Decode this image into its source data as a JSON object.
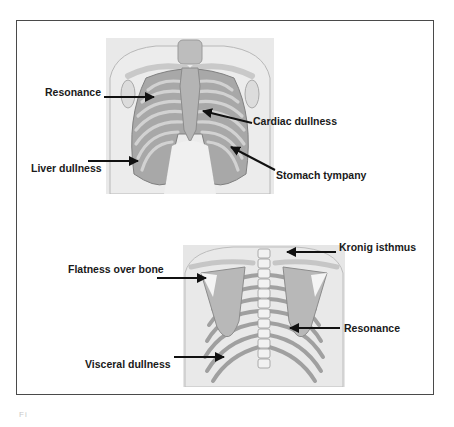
{
  "figure": {
    "anterior_view": {
      "labels": [
        {
          "id": "resonance",
          "text": "Resonance"
        },
        {
          "id": "cardiac-dullness",
          "text": "Cardiac dullness"
        },
        {
          "id": "liver-dullness",
          "text": "Liver dullness"
        },
        {
          "id": "stomach-tympany",
          "text": "Stomach tympany"
        }
      ]
    },
    "posterior_view": {
      "labels": [
        {
          "id": "kronig-isthmus",
          "text": "Kronig isthmus"
        },
        {
          "id": "flatness-over-bone",
          "text": "Flatness over bone"
        },
        {
          "id": "resonance",
          "text": "Resonance"
        },
        {
          "id": "visceral-dullness",
          "text": "Visceral dullness"
        }
      ]
    },
    "caption": "Fi                             "
  }
}
